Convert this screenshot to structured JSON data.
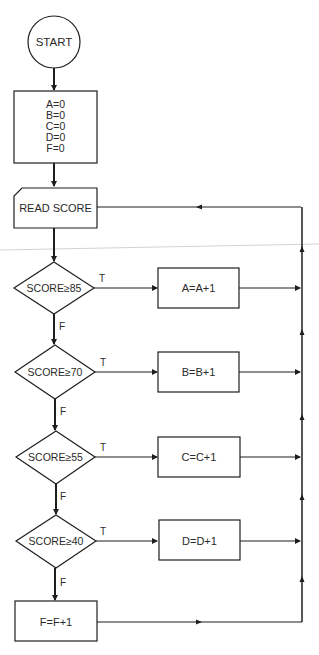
{
  "diagram": {
    "type": "flowchart",
    "start": {
      "label": "START"
    },
    "initialize": {
      "lines": [
        "A=0",
        "B=0",
        "C=0",
        "D=0",
        "F=0"
      ]
    },
    "input": {
      "label": "READ SCORE"
    },
    "decisions": [
      {
        "label": "SCORE≥85",
        "true_label": "T",
        "false_label": "F",
        "action": "A=A+1"
      },
      {
        "label": "SCORE≥70",
        "true_label": "T",
        "false_label": "F",
        "action": "B=B+1"
      },
      {
        "label": "SCORE≥55",
        "true_label": "T",
        "false_label": "F",
        "action": "C=C+1"
      },
      {
        "label": "SCORE≥40",
        "true_label": "T",
        "false_label": "F",
        "action": "D=D+1"
      }
    ],
    "else_action": {
      "label": "F=F+1"
    },
    "colors": {
      "stroke": "#1e1e1e",
      "text": "#2a2a2a",
      "background": "#ffffff",
      "scan_artifact": "#cfcfcf"
    }
  }
}
